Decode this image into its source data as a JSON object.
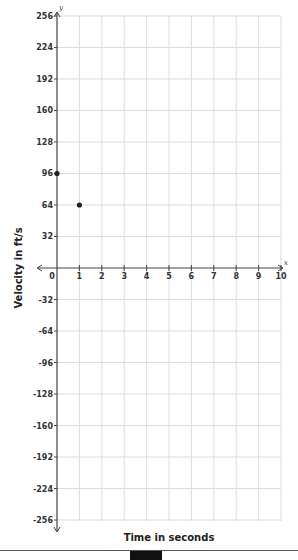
{
  "chart_data": {
    "type": "scatter",
    "title": "",
    "xlabel": "Time in seconds",
    "ylabel": "Velocity in ft/s",
    "x_axis_var": "x",
    "y_axis_var": "y",
    "xlim": [
      0,
      10
    ],
    "ylim": [
      -256,
      256
    ],
    "x_ticks": [
      0,
      1,
      2,
      3,
      4,
      5,
      6,
      7,
      8,
      9,
      10
    ],
    "y_ticks": [
      256,
      224,
      192,
      160,
      128,
      96,
      64,
      32,
      -32,
      -64,
      -96,
      -128,
      -160,
      -192,
      -224,
      -256
    ],
    "grid": true,
    "legend": null,
    "series": [
      {
        "name": "velocity",
        "points": [
          {
            "x": 0,
            "y": 96
          },
          {
            "x": 1,
            "y": 64
          }
        ]
      }
    ]
  },
  "layout": {
    "x0_px": 57,
    "x_unit_px": 22.4,
    "y0_px": 268,
    "y_unit_px": 0.9844,
    "grid_right_px": 281,
    "grid_top_px": 16,
    "grid_bottom_px": 521
  },
  "colors": {
    "grid": "#dddddd",
    "axis": "#444444",
    "point": "#222222"
  }
}
